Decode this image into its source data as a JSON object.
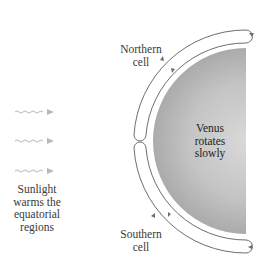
{
  "diagram": {
    "labels": {
      "northern_cell": "Northern\ncell",
      "southern_cell": "Southern\ncell",
      "planet": "Venus\nrotates\nslowly",
      "sunlight": "Sunlight\nwarms the\nequatorial\nregions"
    },
    "sunlight_arrows": 3,
    "colors": {
      "background": "#ffffff",
      "planet_light": "#d8d8d8",
      "planet_dark": "#a8a8a8",
      "cell_outline": "#6e6e6e",
      "arrow": "#b8b8b8",
      "text": "#3a3a3a"
    }
  }
}
